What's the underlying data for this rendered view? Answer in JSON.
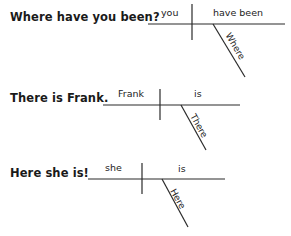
{
  "diagrams": [
    {
      "sentence": "Where have you been?",
      "subject": "you",
      "predicate": "have been",
      "modifier": "Where"
    },
    {
      "sentence": "There is Frank.",
      "subject": "Frank",
      "predicate": "is",
      "modifier": "There"
    },
    {
      "sentence": "Here she is!",
      "subject": "she",
      "predicate": "is",
      "modifier": "Here"
    }
  ],
  "colors": {
    "ink": "#1a1a1a",
    "background": "#ffffff"
  }
}
